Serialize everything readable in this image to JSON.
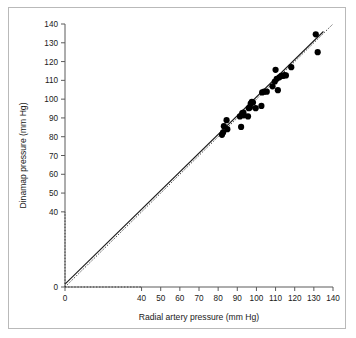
{
  "figure": {
    "background_color": "#ffffff",
    "frame_color": "#b9b9b9",
    "axis_color": "#5b5b5b",
    "point_color": "#000000"
  },
  "chart_data": {
    "type": "scatter",
    "title": "",
    "xlabel": "Radial artery pressure (mm Hg)",
    "ylabel": "Dinamap pressure (mm Hg)",
    "xlim": [
      0,
      140
    ],
    "ylim": [
      0,
      140
    ],
    "xticks": [
      0,
      40,
      50,
      60,
      70,
      80,
      90,
      100,
      110,
      120,
      130,
      140
    ],
    "yticks": [
      0,
      40,
      50,
      60,
      70,
      80,
      90,
      100,
      110,
      120,
      130,
      140
    ],
    "xtick_labels": [
      "0",
      "40",
      "50",
      "60",
      "70",
      "80",
      "90",
      "100",
      "110",
      "120",
      "130",
      "140"
    ],
    "ytick_labels": [
      "0",
      "40",
      "50",
      "60",
      "70",
      "80",
      "90",
      "100",
      "110",
      "120",
      "130",
      "140"
    ],
    "axis_break": true,
    "axis_break_note": "Both axes jump from 0 to 40; 10/20/30 ticks omitted",
    "grid": false,
    "legend": null,
    "series": [
      {
        "name": "Paired pressure measurements",
        "marker": "filled-circle",
        "marker_color": "#000000",
        "points": [
          [
            82.0,
            81.0
          ],
          [
            82.6,
            82.3
          ],
          [
            83.0,
            85.6
          ],
          [
            84.4,
            88.8
          ],
          [
            84.8,
            84.0
          ],
          [
            91.4,
            90.8
          ],
          [
            92.0,
            85.2
          ],
          [
            92.6,
            92.6
          ],
          [
            93.2,
            92.9
          ],
          [
            93.4,
            91.4
          ],
          [
            95.6,
            90.8
          ],
          [
            96.0,
            95.2
          ],
          [
            96.6,
            95.6
          ],
          [
            97.0,
            97.6
          ],
          [
            97.6,
            98.6
          ],
          [
            98.2,
            98.2
          ],
          [
            99.6,
            95.2
          ],
          [
            102.6,
            96.4
          ],
          [
            103.0,
            103.6
          ],
          [
            104.0,
            104.0
          ],
          [
            105.4,
            104.0
          ],
          [
            108.4,
            106.8
          ],
          [
            109.6,
            109.4
          ],
          [
            110.0,
            115.6
          ],
          [
            110.6,
            110.8
          ],
          [
            111.2,
            104.8
          ],
          [
            112.0,
            111.6
          ],
          [
            113.0,
            112.4
          ],
          [
            114.0,
            112.4
          ],
          [
            114.6,
            112.8
          ],
          [
            115.4,
            112.6
          ],
          [
            118.2,
            117.0
          ],
          [
            131.0,
            134.5
          ],
          [
            132.0,
            125.0
          ]
        ]
      }
    ],
    "lines": [
      {
        "name": "regression-line",
        "style": "solid",
        "color": "#1a1a1a",
        "x_range": [
          0,
          135
        ],
        "y_range": [
          1.5,
          136.0
        ]
      },
      {
        "name": "identity-line",
        "style": "dotted",
        "color": "#3a3a3a",
        "x_range": [
          0,
          140
        ],
        "y_range": [
          0,
          140
        ]
      }
    ]
  }
}
